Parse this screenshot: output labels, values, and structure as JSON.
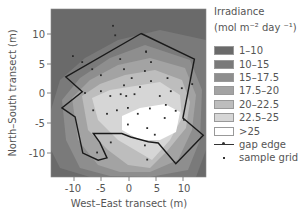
{
  "chart_data": {
    "type": "heatmap",
    "subtype": "filled-contour",
    "title": "",
    "xlabel": "West–East transect (m)",
    "ylabel": "North–South transect (m)",
    "xlim": [
      -14,
      14
    ],
    "ylim": [
      -14,
      14
    ],
    "xticks": [
      -10,
      -5,
      0,
      5,
      10
    ],
    "yticks": [
      -10,
      -5,
      0,
      5,
      10
    ],
    "grid": false,
    "legend_position": "right",
    "legend": {
      "title_line1": "Irradiance",
      "title_line2": "(mol m⁻² day ⁻¹)",
      "bins": [
        {
          "label": "1–10",
          "color": "#6a6a6a"
        },
        {
          "label": "10–15",
          "color": "#7a7a7a"
        },
        {
          "label": "15–17.5",
          "color": "#8e8e8e"
        },
        {
          "label": "17.5–20",
          "color": "#a3a3a3"
        },
        {
          "label": "20–22.5",
          "color": "#bdbdbd"
        },
        {
          "label": "22.5–25",
          "color": "#d6d6d6"
        },
        {
          "label": ">25",
          "color": "#ffffff"
        }
      ],
      "gap_edge_label": "gap edge",
      "sample_grid_label": "sample grid"
    },
    "gap_edge": [
      [
        2.2,
        10.0
      ],
      [
        11.9,
        5.7
      ],
      [
        9.8,
        -4.2
      ],
      [
        13.5,
        -7.1
      ],
      [
        8.5,
        -11.9
      ],
      [
        5.3,
        -8.4
      ],
      [
        3.5,
        -8.2
      ],
      [
        0.3,
        -7.4
      ],
      [
        -1.3,
        -6.8
      ],
      [
        -6.5,
        -6.8
      ],
      [
        -5.3,
        -8.3
      ],
      [
        -4.0,
        -10.9
      ],
      [
        -5.6,
        -11.3
      ],
      [
        -8.4,
        -10.1
      ],
      [
        -9.8,
        -4.0
      ],
      [
        -12.2,
        -2.5
      ],
      [
        -8.5,
        0.2
      ],
      [
        -11.5,
        2.7
      ],
      [
        2.2,
        10.0
      ]
    ],
    "sample_points": [
      [
        -2.9,
        11.3
      ],
      [
        -2.5,
        9.7
      ],
      [
        -10.2,
        6.2
      ],
      [
        -8.5,
        5.2
      ],
      [
        -6.7,
        4.0
      ],
      [
        -5.1,
        3.0
      ],
      [
        -1.6,
        5.7
      ],
      [
        -0.9,
        4.0
      ],
      [
        3.1,
        6.9
      ],
      [
        4.0,
        5.2
      ],
      [
        3.1,
        7.0
      ],
      [
        2.9,
        3.7
      ],
      [
        4.0,
        2.0
      ],
      [
        -5.1,
        0.3
      ],
      [
        -0.9,
        1.3
      ],
      [
        2.0,
        1.0
      ],
      [
        -3.4,
        -0.5
      ],
      [
        -0.5,
        -0.5
      ],
      [
        1.0,
        -0.2
      ],
      [
        5.6,
        -0.5
      ],
      [
        7.6,
        0.3
      ],
      [
        9.6,
        0.8
      ],
      [
        11.5,
        1.5
      ],
      [
        -0.2,
        -2.5
      ],
      [
        -2.2,
        -2.9
      ],
      [
        3.8,
        -2.6
      ],
      [
        1.6,
        -3.5
      ],
      [
        -4.0,
        -3.5
      ],
      [
        -0.2,
        -5.3
      ],
      [
        3.3,
        -5.9
      ],
      [
        4.7,
        -7.0
      ],
      [
        -6.5,
        -2.9
      ],
      [
        -8.0,
        0.0
      ],
      [
        6.7,
        -2.0
      ],
      [
        8.5,
        -3.0
      ],
      [
        10.0,
        -4.5
      ],
      [
        -3.3,
        -8.3
      ],
      [
        -1.5,
        -0.2
      ],
      [
        -5.8,
        -10.0
      ],
      [
        3.3,
        -11.2
      ],
      [
        2.9,
        -8.8
      ],
      [
        6.5,
        -4.2
      ],
      [
        0.5,
        2.5
      ],
      [
        7.0,
        2.5
      ]
    ]
  },
  "axes": {
    "x_tick_labels": [
      "-10",
      "-5",
      "0",
      "5",
      "10"
    ],
    "y_tick_labels": [
      "10",
      "5",
      "0",
      "-5",
      "-10"
    ]
  }
}
